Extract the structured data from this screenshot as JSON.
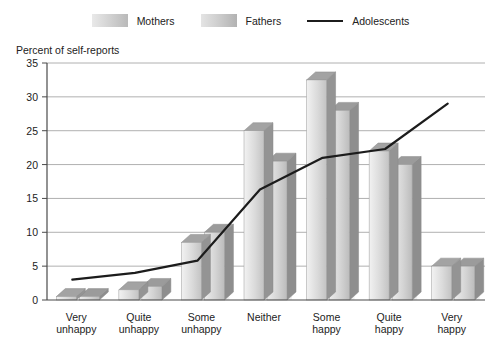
{
  "legend": {
    "items": [
      {
        "label": "Mothers",
        "icon": "bar-swatch-mothers",
        "color": "#d2d2d2"
      },
      {
        "label": "Fathers",
        "icon": "bar-swatch-fathers",
        "color": "#c9c9c9"
      },
      {
        "label": "Adolescents",
        "icon": "line-swatch-adolescents",
        "color": "#1c1c1c"
      }
    ]
  },
  "axis": {
    "y_title": "Percent of self-reports",
    "y_ticks": [
      "0",
      "5",
      "10",
      "15",
      "20",
      "25",
      "30",
      "35"
    ]
  },
  "chart_data": {
    "type": "bar",
    "title": "",
    "xlabel": "",
    "ylabel": "Percent of self-reports",
    "ylim": [
      0,
      35
    ],
    "ytick_step": 5,
    "grid": true,
    "legend_position": "top-center",
    "categories": [
      "Very unhappy",
      "Quite unhappy",
      "Some unhappy",
      "Neither",
      "Some happy",
      "Quite happy",
      "Very happy"
    ],
    "category_lines": [
      [
        "Very",
        "unhappy"
      ],
      [
        "Quite",
        "unhappy"
      ],
      [
        "Some",
        "unhappy"
      ],
      [
        "Neither",
        ""
      ],
      [
        "Some",
        "happy"
      ],
      [
        "Quite",
        "happy"
      ],
      [
        "Very",
        "happy"
      ]
    ],
    "series": [
      {
        "name": "Mothers",
        "type": "bar",
        "values": [
          0.5,
          1.5,
          8.5,
          25.0,
          32.5,
          22.0,
          5.0
        ]
      },
      {
        "name": "Fathers",
        "type": "bar",
        "values": [
          0.5,
          2.0,
          10.0,
          20.5,
          28.0,
          20.0,
          5.0
        ]
      },
      {
        "name": "Adolescents",
        "type": "line",
        "values": [
          3.0,
          4.0,
          5.8,
          16.3,
          21.0,
          22.3,
          29.0
        ]
      }
    ]
  }
}
